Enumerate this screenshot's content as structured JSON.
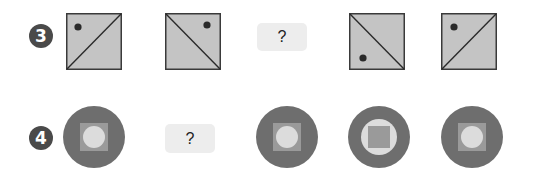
{
  "rows": [
    {
      "number": "3",
      "items": [
        {
          "type": "square",
          "diagonal": "bl-tr",
          "dot": "top-left"
        },
        {
          "type": "square",
          "diagonal": "tl-br",
          "dot": "top-right"
        },
        {
          "type": "question",
          "label": "?"
        },
        {
          "type": "square",
          "diagonal": "tl-br",
          "dot": "bottom-left"
        },
        {
          "type": "square",
          "diagonal": "bl-tr",
          "dot": "top-left"
        }
      ]
    },
    {
      "number": "4",
      "items": [
        {
          "type": "disc",
          "pattern": "circle-in-square"
        },
        {
          "type": "question",
          "label": "?"
        },
        {
          "type": "disc",
          "pattern": "circle-in-square"
        },
        {
          "type": "disc",
          "pattern": "square-in-circle"
        },
        {
          "type": "disc",
          "pattern": "circle-in-square"
        }
      ]
    }
  ],
  "colors": {
    "badge": "#4a4a4a",
    "tile_fill": "#c4c4c4",
    "tile_stroke": "#3a3a3a",
    "dot": "#2a2a2a",
    "disc_outer": "#6e6e6e",
    "disc_mid": "#9a9a9a",
    "disc_inner": "#dcdcdc",
    "question_bg": "#ededed"
  }
}
